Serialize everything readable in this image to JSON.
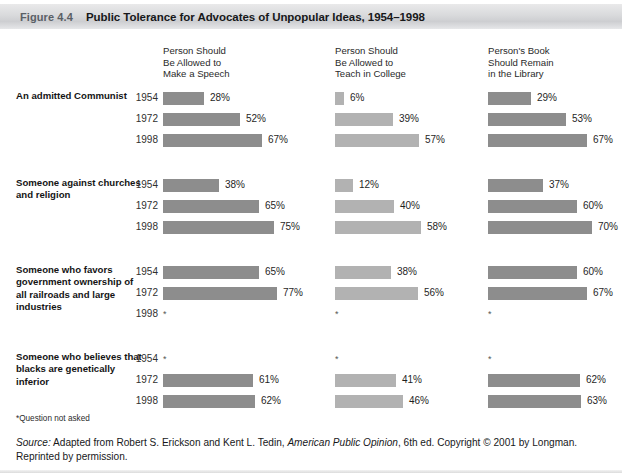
{
  "header": {
    "figure_number": "Figure 4.4",
    "title": "Public Tolerance for Advocates of Unpopular Ideas, 1954–1998"
  },
  "footnote": "*Question not asked",
  "source": {
    "label": "Source:",
    "text_1": " Adapted from Robert S. Erickson and Kent L. Tedin, ",
    "italic_title": "American Public Opinion",
    "text_2": ", 6th ed. Copyright © 2001 by Longman. Reprinted by permission."
  },
  "colors": {
    "bar_dark": "#8d8d8d",
    "bar_light": "#b2b2b2",
    "title_bar": "#d9dadc"
  },
  "chart_data": {
    "type": "bar",
    "title": "Public Tolerance for Advocates of Unpopular Ideas, 1954–1998",
    "orientation": "horizontal",
    "xlabel": "",
    "ylabel": "",
    "xlim": [
      0,
      100
    ],
    "grid": false,
    "legend": "none",
    "value_suffix": "%",
    "not_asked_marker": "*",
    "columns": [
      {
        "label": "Person Should\nBe Allowed to\nMake a Speech",
        "shade": "#8d8d8d"
      },
      {
        "label": "Person Should\nBe Allowed to\nTeach in College",
        "shade": "#b2b2b2"
      },
      {
        "label": "Person's Book\nShould Remain\nin the Library",
        "shade": "#8d8d8d"
      }
    ],
    "years": [
      "1954",
      "1972",
      "1998"
    ],
    "groups": [
      {
        "label": "An admitted Communist",
        "rows": [
          {
            "year": "1954",
            "values": [
              28,
              6,
              29
            ],
            "labels": [
              "28%",
              "6%",
              "29%"
            ]
          },
          {
            "year": "1972",
            "values": [
              52,
              39,
              53
            ],
            "labels": [
              "52%",
              "39%",
              "53%"
            ]
          },
          {
            "year": "1998",
            "values": [
              67,
              57,
              67
            ],
            "labels": [
              "67%",
              "57%",
              "67%"
            ]
          }
        ]
      },
      {
        "label": "Someone against churches and religion",
        "rows": [
          {
            "year": "1954",
            "values": [
              38,
              12,
              37
            ],
            "labels": [
              "38%",
              "12%",
              "37%"
            ]
          },
          {
            "year": "1972",
            "values": [
              65,
              40,
              60
            ],
            "labels": [
              "65%",
              "40%",
              "60%"
            ]
          },
          {
            "year": "1998",
            "values": [
              75,
              58,
              70
            ],
            "labels": [
              "75%",
              "58%",
              "70%"
            ]
          }
        ]
      },
      {
        "label": "Someone who favors government ownership of all railroads and large industries",
        "rows": [
          {
            "year": "1954",
            "values": [
              65,
              38,
              60
            ],
            "labels": [
              "65%",
              "38%",
              "60%"
            ]
          },
          {
            "year": "1972",
            "values": [
              77,
              56,
              67
            ],
            "labels": [
              "77%",
              "56%",
              "67%"
            ]
          },
          {
            "year": "1998",
            "values": [
              null,
              null,
              null
            ],
            "labels": [
              "*",
              "*",
              "*"
            ]
          }
        ]
      },
      {
        "label": "Someone who believes that blacks are genetically inferior",
        "rows": [
          {
            "year": "1954",
            "values": [
              null,
              null,
              null
            ],
            "labels": [
              "*",
              "*",
              "*"
            ]
          },
          {
            "year": "1972",
            "values": [
              61,
              41,
              62
            ],
            "labels": [
              "61%",
              "41%",
              "62%"
            ]
          },
          {
            "year": "1998",
            "values": [
              62,
              46,
              63
            ],
            "labels": [
              "62%",
              "46%",
              "63%"
            ]
          }
        ]
      }
    ]
  }
}
